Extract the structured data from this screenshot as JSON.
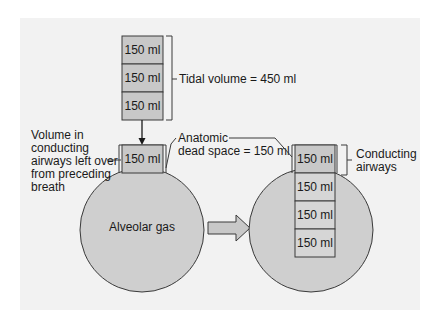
{
  "colors": {
    "page_bg": "#ffffff",
    "panel_bg": "#f2f2f2",
    "box_fill": "#c8c8c8",
    "box_fill_light": "#d6d6d6",
    "circle_fill": "#cfcfcf",
    "stroke": "#3a3a3a",
    "text": "#1a1a1a"
  },
  "left": {
    "tidal_boxes": [
      "150 ml",
      "150 ml",
      "150 ml"
    ],
    "tidal_label": "Tidal volume = 450 ml",
    "dead_space_box": "150 ml",
    "leftover_label": [
      "Volume in",
      "conducting",
      "airways left over",
      "from preceding",
      "breath"
    ],
    "dead_space_label": [
      "Anatomic",
      "dead space = 150 ml"
    ],
    "alveolar_label": "Alveolar gas"
  },
  "right": {
    "conducting_box": "150 ml",
    "alveolar_boxes": [
      "150 ml",
      "150 ml",
      "150 ml"
    ],
    "conducting_label": [
      "Conducting",
      "airways"
    ]
  },
  "transition_arrow": "right-arrow"
}
